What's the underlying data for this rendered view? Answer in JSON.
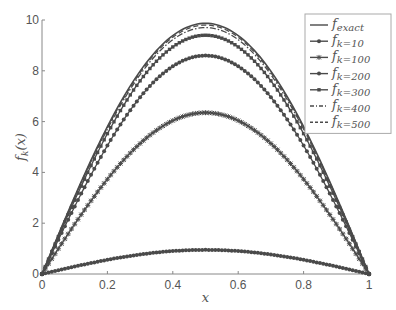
{
  "chart_data": {
    "type": "line",
    "title": "",
    "xlabel": "x",
    "ylabel": "f_k(x)",
    "xlim": [
      0,
      1
    ],
    "ylim": [
      0,
      10
    ],
    "xticks": [
      "0",
      "0.2",
      "0.4",
      "0.6",
      "0.8",
      "1"
    ],
    "yticks": [
      "0",
      "2",
      "4",
      "6",
      "8",
      "10"
    ],
    "grid": false,
    "legend_position": "upper right",
    "series": [
      {
        "name": "f_exact",
        "label_main": "f",
        "label_sub": "exact",
        "style": "solid",
        "peak": 9.87
      },
      {
        "name": "f_k=10",
        "label_main": "f",
        "label_sub": "k=10",
        "style": "solid-dot-marker",
        "peak": 0.95
      },
      {
        "name": "f_k=100",
        "label_main": "f",
        "label_sub": "k=100",
        "style": "solid-star-marker",
        "peak": 6.35
      },
      {
        "name": "f_k=200",
        "label_main": "f",
        "label_sub": "k=200",
        "style": "solid-dot-marker",
        "peak": 8.6
      },
      {
        "name": "f_k=300",
        "label_main": "f",
        "label_sub": "k=300",
        "style": "solid-square-marker",
        "peak": 9.4
      },
      {
        "name": "f_k=400",
        "label_main": "f",
        "label_sub": "k=400",
        "style": "dash-dot",
        "peak": 9.7
      },
      {
        "name": "f_k=500",
        "label_main": "f",
        "label_sub": "k=500",
        "style": "dashed",
        "peak": 9.8
      }
    ],
    "curve_shape": "f(x) = peak * sin(pi x)"
  }
}
